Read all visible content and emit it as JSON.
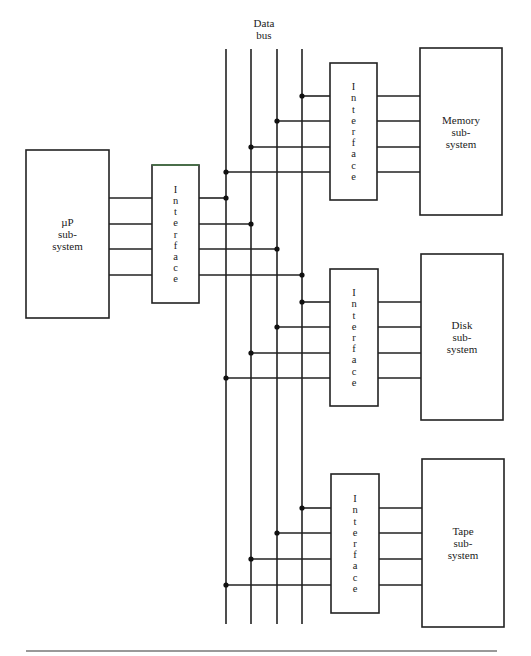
{
  "diagram": {
    "bus_label": [
      "Data",
      "bus"
    ],
    "bus_lines_x": [
      226,
      251,
      277,
      302
    ],
    "bus_top_y": 49,
    "bus_bottom_y": 624,
    "processor": {
      "label": [
        "µP",
        "sub-",
        "system"
      ],
      "box": {
        "x": 26,
        "y": 150,
        "w": 83,
        "h": 168
      },
      "interface": {
        "label": "Interface",
        "box": {
          "x": 152,
          "y": 165,
          "w": 47,
          "h": 138
        }
      },
      "wires_y": [
        198,
        224,
        249,
        275
      ],
      "bus_taps": [
        0,
        1,
        2,
        3
      ]
    },
    "subsystems": [
      {
        "name": "memory",
        "label": [
          "Memory",
          "sub-",
          "system"
        ],
        "box": {
          "x": 420,
          "y": 48,
          "w": 82,
          "h": 167
        },
        "interface": {
          "label": "Interface",
          "box": {
            "x": 330,
            "y": 63,
            "w": 47,
            "h": 137
          }
        },
        "wires_y": [
          96,
          121,
          147,
          172
        ],
        "bus_taps": [
          3,
          2,
          1,
          0
        ]
      },
      {
        "name": "disk",
        "label": [
          "Disk",
          "sub-",
          "system"
        ],
        "box": {
          "x": 421,
          "y": 254,
          "w": 82,
          "h": 166
        },
        "interface": {
          "label": "Interface",
          "box": {
            "x": 330,
            "y": 269,
            "w": 48,
            "h": 137
          }
        },
        "wires_y": [
          302,
          327,
          353,
          378
        ],
        "bus_taps": [
          3,
          2,
          1,
          0
        ]
      },
      {
        "name": "tape",
        "label": [
          "Tape",
          "sub-",
          "system"
        ],
        "box": {
          "x": 422,
          "y": 459,
          "w": 82,
          "h": 168
        },
        "interface": {
          "label": "Interface",
          "box": {
            "x": 331,
            "y": 474,
            "w": 48,
            "h": 139
          }
        },
        "wires_y": [
          508,
          533,
          559,
          585
        ],
        "bus_taps": [
          3,
          2,
          1,
          0
        ]
      }
    ],
    "bottom_rule": {
      "x1": 26,
      "x2": 497,
      "y": 651
    },
    "colors": {
      "line": "#222222",
      "rule": "#777777",
      "interface_top_tint": "#4a7a4a"
    }
  }
}
